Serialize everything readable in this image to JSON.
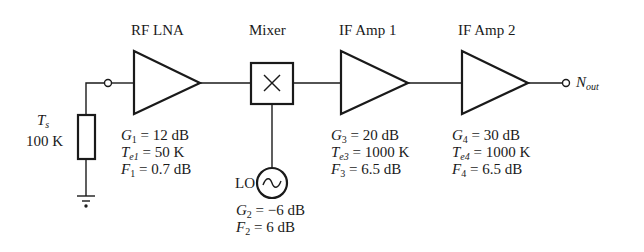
{
  "stages": [
    {
      "label": "RF LNA",
      "params": [
        {
          "sym": "G",
          "sub": "1",
          "value": "= 12 dB"
        },
        {
          "sym": "T",
          "sub": "e1",
          "value": "= 50 K"
        },
        {
          "sym": "F",
          "sub": "1",
          "value": "= 0.7 dB"
        }
      ]
    },
    {
      "label": "Mixer",
      "params": [
        {
          "sym": "G",
          "sub": "2",
          "value": "= −6 dB"
        },
        {
          "sym": "F",
          "sub": "2",
          "value": "= 6 dB"
        }
      ]
    },
    {
      "label": "IF Amp 1",
      "params": [
        {
          "sym": "G",
          "sub": "3",
          "value": "= 20 dB"
        },
        {
          "sym": "T",
          "sub": "e3",
          "value": "= 1000 K"
        },
        {
          "sym": "F",
          "sub": "3",
          "value": "= 6.5 dB"
        }
      ]
    },
    {
      "label": "IF Amp 2",
      "params": [
        {
          "sym": "G",
          "sub": "4",
          "value": "= 30 dB"
        },
        {
          "sym": "T",
          "sub": "e4",
          "value": "= 1000 K"
        },
        {
          "sym": "F",
          "sub": "4",
          "value": "= 6.5 dB"
        }
      ]
    }
  ],
  "source": {
    "sym": "T",
    "sub": "s",
    "value": "100 K"
  },
  "lo": {
    "label": "LO",
    "symbol": "~"
  },
  "mixer_symbol": "×",
  "output": {
    "sym": "N",
    "sub": "out"
  },
  "colors": {
    "stroke": "#1a1a1a",
    "background": "#ffffff"
  }
}
